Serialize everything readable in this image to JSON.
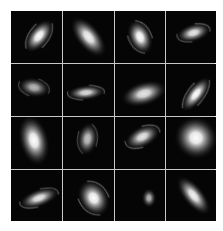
{
  "figure": {
    "rows": 4,
    "cols": 4,
    "grid_line_color": "#c8c8c8",
    "cell_background": "#050505",
    "galaxies": [
      {
        "row": 0,
        "col": 0,
        "type": "spiral",
        "cx": 0.55,
        "cy": 0.48,
        "rx": 0.14,
        "ry": 0.26,
        "angle": 40,
        "brightness": 1.0,
        "arms": true
      },
      {
        "row": 0,
        "col": 1,
        "type": "elliptical",
        "cx": 0.5,
        "cy": 0.5,
        "rx": 0.16,
        "ry": 0.32,
        "angle": -40,
        "brightness": 0.95,
        "arms": false
      },
      {
        "row": 0,
        "col": 2,
        "type": "spiral",
        "cx": 0.5,
        "cy": 0.5,
        "rx": 0.16,
        "ry": 0.24,
        "angle": -25,
        "brightness": 1.0,
        "arms": true
      },
      {
        "row": 0,
        "col": 3,
        "type": "spiral",
        "cx": 0.55,
        "cy": 0.42,
        "rx": 0.24,
        "ry": 0.12,
        "angle": -15,
        "brightness": 0.9,
        "arms": true
      },
      {
        "row": 1,
        "col": 0,
        "type": "spiral",
        "cx": 0.45,
        "cy": 0.45,
        "rx": 0.22,
        "ry": 0.13,
        "angle": 10,
        "brightness": 0.7,
        "arms": true
      },
      {
        "row": 1,
        "col": 1,
        "type": "spiral",
        "cx": 0.45,
        "cy": 0.55,
        "rx": 0.26,
        "ry": 0.1,
        "angle": -5,
        "brightness": 0.85,
        "arms": true
      },
      {
        "row": 1,
        "col": 2,
        "type": "elliptical",
        "cx": 0.58,
        "cy": 0.57,
        "rx": 0.32,
        "ry": 0.16,
        "angle": -15,
        "brightness": 0.9,
        "arms": false
      },
      {
        "row": 1,
        "col": 3,
        "type": "spiral",
        "cx": 0.6,
        "cy": 0.58,
        "rx": 0.12,
        "ry": 0.28,
        "angle": 40,
        "brightness": 1.0,
        "arms": true
      },
      {
        "row": 2,
        "col": 0,
        "type": "elliptical",
        "cx": 0.45,
        "cy": 0.45,
        "rx": 0.2,
        "ry": 0.34,
        "angle": -15,
        "brightness": 1.0,
        "arms": false
      },
      {
        "row": 2,
        "col": 1,
        "type": "spiral",
        "cx": 0.48,
        "cy": 0.42,
        "rx": 0.14,
        "ry": 0.22,
        "angle": 10,
        "brightness": 0.75,
        "arms": true
      },
      {
        "row": 2,
        "col": 2,
        "type": "spiral",
        "cx": 0.55,
        "cy": 0.38,
        "rx": 0.26,
        "ry": 0.14,
        "angle": -25,
        "brightness": 0.9,
        "arms": true
      },
      {
        "row": 2,
        "col": 3,
        "type": "elliptical",
        "cx": 0.6,
        "cy": 0.4,
        "rx": 0.3,
        "ry": 0.28,
        "angle": 20,
        "brightness": 1.0,
        "arms": false
      },
      {
        "row": 3,
        "col": 0,
        "type": "spiral",
        "cx": 0.55,
        "cy": 0.55,
        "rx": 0.28,
        "ry": 0.12,
        "angle": -20,
        "brightness": 0.9,
        "arms": true
      },
      {
        "row": 3,
        "col": 1,
        "type": "spiral",
        "cx": 0.6,
        "cy": 0.55,
        "rx": 0.2,
        "ry": 0.26,
        "angle": -30,
        "brightness": 1.0,
        "arms": true
      },
      {
        "row": 3,
        "col": 2,
        "type": "compact",
        "cx": 0.68,
        "cy": 0.55,
        "rx": 0.1,
        "ry": 0.13,
        "angle": 0,
        "brightness": 0.7,
        "arms": false
      },
      {
        "row": 3,
        "col": 3,
        "type": "elliptical",
        "cx": 0.55,
        "cy": 0.5,
        "rx": 0.14,
        "ry": 0.32,
        "angle": -40,
        "brightness": 0.95,
        "arms": false
      }
    ]
  }
}
